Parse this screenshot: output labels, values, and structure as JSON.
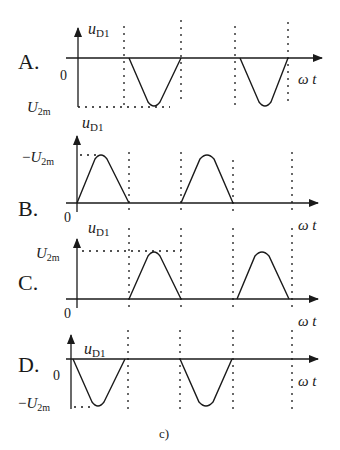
{
  "caption": "c)",
  "axis_labels": {
    "y": "u",
    "y_sub": "D1",
    "x": "ω t",
    "zero": "0"
  },
  "panels": [
    {
      "letter": "A.",
      "level_label": "U",
      "level_sub": "2m",
      "level_prefix": "",
      "waveform": "negative half-waves starting at first dashed line"
    },
    {
      "letter": "B.",
      "level_label": "U",
      "level_sub": "2m",
      "level_prefix": "−",
      "waveform": "positive half-waves starting at origin"
    },
    {
      "letter": "C.",
      "level_label": "U",
      "level_sub": "2m",
      "level_prefix": "",
      "waveform": "positive half-waves starting at first dashed line"
    },
    {
      "letter": "D.",
      "level_label": "U",
      "level_sub": "2m",
      "level_prefix": "−",
      "waveform": "negative half-waves starting at origin"
    }
  ]
}
